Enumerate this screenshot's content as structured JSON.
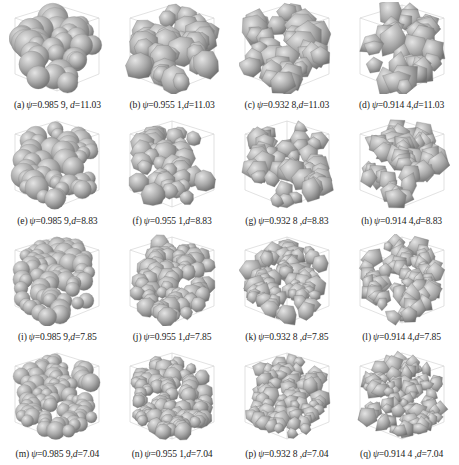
{
  "figure": {
    "psi_symbol": "ψ",
    "d_symbol": "d",
    "columns_psi": [
      "0.985 9",
      "0.955 1",
      "0.932 8",
      "0.914 4"
    ],
    "rows_d": [
      "11.03",
      "8.83",
      "7.85",
      "7.04"
    ],
    "colors": {
      "particle": "#a9a9a9",
      "particle_light": "#e4e4e4",
      "particle_dark": "#6f6f6f",
      "box_line": "#cfcfcf"
    },
    "panels": [
      {
        "label": "(a)",
        "psi": "0.985 9",
        "sep": ", ",
        "d": "11.03",
        "shape": "sphere",
        "n": 26
      },
      {
        "label": "(b)",
        "psi": "0.955 1",
        "sep": ",",
        "d": "11.03",
        "shape": "rounded",
        "n": 26
      },
      {
        "label": "(c)",
        "psi": "0.932 8",
        "sep": ",",
        "d": "11.03",
        "shape": "angular",
        "n": 26
      },
      {
        "label": "(d)",
        "psi": "0.914 4",
        "sep": ",",
        "d": "11.03",
        "shape": "polyhedral",
        "n": 26
      },
      {
        "label": "(e)",
        "psi": "0.985 9",
        "sep": ",",
        "d": "8.83",
        "shape": "sphere",
        "n": 40
      },
      {
        "label": "(f)",
        "psi": "0.955 1",
        "sep": ",",
        "d": "8.83",
        "shape": "rounded",
        "n": 40
      },
      {
        "label": "(g)",
        "psi": "0.932 8",
        "sep": " ,",
        "d": "8.83",
        "shape": "angular",
        "n": 40
      },
      {
        "label": "(h)",
        "psi": "0.914 4",
        "sep": ",",
        "d": "8.83",
        "shape": "polyhedral",
        "n": 40
      },
      {
        "label": "(i)",
        "psi": "0.985 9",
        "sep": ",",
        "d": "7.85",
        "shape": "sphere",
        "n": 55
      },
      {
        "label": "(j)",
        "psi": "0.955 1",
        "sep": ",",
        "d": "7.85",
        "shape": "rounded",
        "n": 55
      },
      {
        "label": "(k)",
        "psi": "0.932 8",
        "sep": " ,",
        "d": "7.85",
        "shape": "angular",
        "n": 55
      },
      {
        "label": "(l)",
        "psi": "0.914 4",
        "sep": ",",
        "d": "7.85",
        "shape": "polyhedral",
        "n": 55
      },
      {
        "label": "(m)",
        "psi": "0.985 9",
        "sep": ",",
        "d": "7.04",
        "shape": "sphere",
        "n": 70
      },
      {
        "label": "(n)",
        "psi": "0.955 1",
        "sep": ",",
        "d": "7.04",
        "shape": "rounded",
        "n": 70
      },
      {
        "label": "(p)",
        "psi": "0.932 8",
        "sep": " ,",
        "d": "7.04",
        "shape": "angular",
        "n": 70
      },
      {
        "label": "(q)",
        "psi": "0.914 4",
        "sep": " ,",
        "d": "7.04",
        "shape": "polyhedral",
        "n": 70
      }
    ]
  }
}
